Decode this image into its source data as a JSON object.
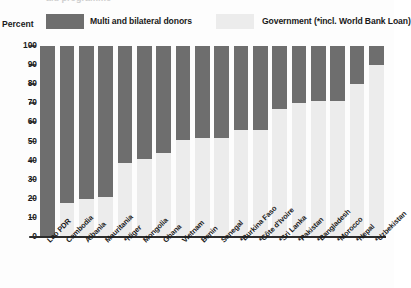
{
  "title": {
    "cut_off_text": "aid programme"
  },
  "axis": {
    "y_caption": "Percent"
  },
  "legend": {
    "items": [
      {
        "label": "Multi and bilateral donors",
        "color": "#6e6e6e",
        "key": "donors"
      },
      {
        "label": "Government (*incl. World Bank Loan)",
        "color": "#ececec",
        "key": "government"
      }
    ]
  },
  "chart_data": {
    "type": "bar",
    "stacked": true,
    "title": "",
    "subtitle": "",
    "xlabel": "",
    "ylabel": "Percent",
    "ylim": [
      0,
      100
    ],
    "yticks": [
      0,
      10,
      20,
      30,
      40,
      50,
      60,
      70,
      80,
      90,
      100
    ],
    "grid": false,
    "legend_position": "top",
    "categories": [
      "Lao PDR",
      "Cambodia",
      "Albania",
      "Mauritania",
      "*Niger",
      "Mongolia",
      "Ghana",
      "Vietnam",
      "Benin",
      "Senegal",
      "*Burkina Faso",
      "*Côte d'Ivoire",
      "*Sri Lanka",
      "*Pakistan",
      "*Bangladesh",
      "*Morocco",
      "*Nepal",
      "*Uzbekistan"
    ],
    "series": [
      {
        "name": "Multi and bilateral donors",
        "color": "#6e6e6e",
        "values": [
          100,
          82,
          80,
          79,
          61,
          59,
          56,
          49,
          48,
          48,
          44,
          44,
          33,
          30,
          29,
          29,
          20,
          10
        ]
      },
      {
        "name": "Government (*incl. World Bank Loan)",
        "color": "#ececec",
        "values": [
          0,
          18,
          20,
          21,
          39,
          41,
          44,
          51,
          52,
          52,
          56,
          56,
          67,
          70,
          71,
          71,
          80,
          90
        ]
      }
    ]
  }
}
